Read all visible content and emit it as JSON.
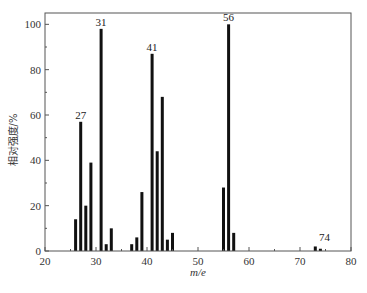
{
  "chart_data": {
    "type": "bar",
    "title": "",
    "xlabel": "m/e",
    "ylabel": "相对强度/%",
    "xlim": [
      20,
      80
    ],
    "ylim": [
      0,
      105
    ],
    "xticks": [
      20,
      30,
      40,
      50,
      60,
      70,
      80
    ],
    "yticks": [
      0,
      20,
      40,
      60,
      80,
      100
    ],
    "grid": false,
    "legend": null,
    "x": [
      26,
      27,
      28,
      29,
      31,
      32,
      33,
      37,
      38,
      39,
      41,
      42,
      43,
      44,
      45,
      55,
      56,
      57,
      73,
      74
    ],
    "values": [
      14,
      57,
      20,
      39,
      98,
      3,
      10,
      3,
      6,
      26,
      87,
      44,
      68,
      5,
      8,
      28,
      100,
      8,
      2,
      1
    ],
    "annotations": [
      {
        "x": 27,
        "text": "27"
      },
      {
        "x": 31,
        "text": "31"
      },
      {
        "x": 41,
        "text": "41"
      },
      {
        "x": 56,
        "text": "56"
      },
      {
        "x": 74,
        "text": "74"
      }
    ],
    "bar_color": "#111111",
    "axis_color": "#555555"
  }
}
